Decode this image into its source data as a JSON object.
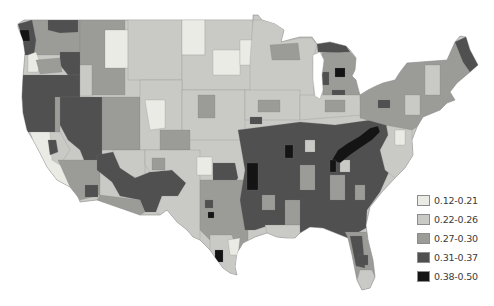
{
  "chart_data": {
    "type": "heatmap",
    "subtype": "choropleth map",
    "title": "",
    "base_class": 1,
    "legend_position": "bottom-right",
    "legend": [
      {
        "label": "0.12-0.21",
        "min": 0.12,
        "max": 0.21,
        "color": "#ebebe6"
      },
      {
        "label": "0.22-0.26",
        "min": 0.22,
        "max": 0.26,
        "color": "#c9c9c5"
      },
      {
        "label": "0.27-0.30",
        "min": 0.27,
        "max": 0.3,
        "color": "#9b9b98"
      },
      {
        "label": "0.31-0.37",
        "min": 0.31,
        "max": 0.37,
        "color": "#505050"
      },
      {
        "label": "0.38-0.50",
        "min": 0.38,
        "max": 0.5,
        "color": "#141414"
      }
    ],
    "outline": "18,24 24,20 32,20 253,20 253,15 258,15 262,20 275,24 284,30 281,42 292,39 300,37 312,37 317,44 330,42 346,46 350,50 356,58 355,70 352,76 356,80 358,88 360,95 368,90 376,86 383,83 395,80 400,72 407,63 447,60 455,42 460,36 466,37 470,50 478,65 470,72 457,83 450,92 455,100 447,103 440,110 423,117 417,127 412,140 413,155 405,168 395,178 382,192 370,207 366,225 368,240 373,260 375,277 370,288 362,290 357,280 352,255 348,238 333,232 323,228 310,227 300,233 295,238 287,238 277,237 267,233 255,237 243,243 237,253 235,267 237,275 230,273 223,268 217,260 210,250 200,240 193,237 187,230 177,222 167,210 160,215 140,215 120,208 97,200 80,202 78,197 70,187 57,180 47,167 40,153 33,140 27,130 23,113 22,97 23,77 25,53 23,40 18,27",
    "water": [
      "313,55 320,52 324,60 322,75 323,90 320,99 315,96 313,80"
    ],
    "regions": [
      {
        "class": 2,
        "points": "30,20 80,20 80,55 30,55"
      },
      {
        "class": 3,
        "points": "48,20 78,20 78,32 60,33 48,30"
      },
      {
        "class": 3,
        "points": "18,24 32,20 36,40 34,55 22,55 23,40"
      },
      {
        "class": 4,
        "points": "20,30 29,30 30,41 21,41"
      },
      {
        "class": 0,
        "points": "28,55 36,52 40,62 38,72 28,72"
      },
      {
        "class": 3,
        "points": "60,52 80,52 82,75 68,75 60,65"
      },
      {
        "class": 2,
        "points": "36,60 60,58 62,72 40,74"
      },
      {
        "class": 3,
        "points": "18,75 80,75 80,97 60,97 55,132 27,132 23,113 22,97"
      },
      {
        "class": 3,
        "points": "60,97 102,97 102,165 86,165 80,150 68,140 60,125"
      },
      {
        "class": 2,
        "points": "55,97 60,97 60,140 55,135"
      },
      {
        "class": 2,
        "points": "80,20 125,20 125,95 80,95"
      },
      {
        "class": 1,
        "points": "80,65 92,65 92,96 80,96"
      },
      {
        "class": 0,
        "points": "105,30 128,30 128,68 105,68"
      },
      {
        "class": 1,
        "points": "128,20 182,20 182,80 128,80"
      },
      {
        "class": 0,
        "points": "182,20 205,20 205,55 182,55"
      },
      {
        "class": 1,
        "points": "205,20 253,20 253,90 182,90 182,55 205,55"
      },
      {
        "class": 0,
        "points": "213,50 240,50 240,75 213,75"
      },
      {
        "class": 0,
        "points": "240,40 262,40 262,65 240,65"
      },
      {
        "class": 2,
        "points": "102,97 140,97 140,150 102,150"
      },
      {
        "class": 1,
        "points": "140,80 182,80 182,150 140,150"
      },
      {
        "class": 0,
        "points": "145,100 165,100 165,128 150,130"
      },
      {
        "class": 1,
        "points": "182,90 245,90 245,140 182,140"
      },
      {
        "class": 2,
        "points": "198,95 215,95 215,118 198,118"
      },
      {
        "class": 2,
        "points": "160,130 190,130 190,150 160,150"
      },
      {
        "class": 0,
        "points": "30,132 50,132 58,150 68,175 78,197 70,187 57,180 47,167 40,153 33,140"
      },
      {
        "class": 1,
        "points": "50,132 60,132 70,150 60,165 52,160"
      },
      {
        "class": 3,
        "points": "48,140 56,140 58,152 50,155"
      },
      {
        "class": 2,
        "points": "58,160 100,160 100,195 80,200 70,187"
      },
      {
        "class": 3,
        "points": "85,185 98,185 98,197 85,197"
      },
      {
        "class": 1,
        "points": "113,150 145,150 145,180 118,172"
      },
      {
        "class": 3,
        "points": "97,155 113,152 120,168 135,178 150,172 172,170 186,183 178,196 162,196 156,212 145,212 140,200 120,196 112,182 97,170"
      },
      {
        "class": 2,
        "points": "100,195 140,200 145,212 140,215 120,208 97,200"
      },
      {
        "class": 1,
        "points": "145,150 200,150 200,240 193,237 187,230 177,222 167,210 160,215 156,212 162,196 178,196 186,183 172,170 150,172 145,165"
      },
      {
        "class": 0,
        "points": "197,157 212,157 212,175 197,175"
      },
      {
        "class": 2,
        "points": "152,158 165,158 165,170 152,170"
      },
      {
        "class": 3,
        "points": "213,163 235,163 238,178 232,186 213,183"
      },
      {
        "class": 2,
        "points": "200,180 248,180 248,240 237,253 225,245 210,240 200,230"
      },
      {
        "class": 3,
        "points": "205,200 213,200 213,208 205,208"
      },
      {
        "class": 4,
        "points": "208,212 214,212 214,218 208,218"
      },
      {
        "class": 1,
        "points": "210,235 232,235 238,255 235,267 237,275 230,273 223,268 217,260 210,250"
      },
      {
        "class": 4,
        "points": "215,250 223,250 223,262 215,262"
      },
      {
        "class": 0,
        "points": "228,240 240,238 238,255 230,255"
      },
      {
        "class": 1,
        "points": "253,20 262,20 280,24 284,30 281,42 300,38 312,38 317,45 313,60 314,100 250,100 250,60"
      },
      {
        "class": 2,
        "points": "270,45 298,43 300,60 272,60"
      },
      {
        "class": 3,
        "points": "317,44 330,42 346,46 350,52 340,53 318,52"
      },
      {
        "class": 2,
        "points": "322,53 350,52 356,58 355,70 352,76 356,80 358,88 360,98 323,100"
      },
      {
        "class": 4,
        "points": "335,68 345,68 345,77 335,77"
      },
      {
        "class": 3,
        "points": "322,72 329,72 329,85 322,85"
      },
      {
        "class": 3,
        "points": "332,90 345,90 345,96 332,96"
      },
      {
        "class": 1,
        "points": "245,90 300,90 300,120 245,120"
      },
      {
        "class": 2,
        "points": "258,100 280,100 280,112 258,112"
      },
      {
        "class": 3,
        "points": "250,117 262,117 262,124 250,124"
      },
      {
        "class": 1,
        "points": "300,95 360,95 362,115 300,120"
      },
      {
        "class": 2,
        "points": "325,100 345,100 345,112 325,112"
      },
      {
        "class": 3,
        "points": "238,130 300,122 335,125 385,118 395,125 392,165 380,192 367,210 366,228 348,238 333,232 323,228 310,227 300,233 290,232 285,225 270,225 255,230 245,230 240,200 245,170"
      },
      {
        "class": 2,
        "points": "300,165 315,165 315,190 300,190"
      },
      {
        "class": 2,
        "points": "330,175 345,175 345,200 330,200"
      },
      {
        "class": 2,
        "points": "355,185 365,185 365,200 355,200"
      },
      {
        "class": 2,
        "points": "262,195 275,195 275,210 262,210"
      },
      {
        "class": 2,
        "points": "285,200 300,200 300,225 285,225"
      },
      {
        "class": 1,
        "points": "305,140 315,140 315,152 305,152"
      },
      {
        "class": 1,
        "points": "340,160 350,160 350,172 340,172"
      },
      {
        "class": 4,
        "points": "247,163 258,163 258,190 247,190"
      },
      {
        "class": 4,
        "points": "285,145 293,145 293,158 285,158"
      },
      {
        "class": 4,
        "points": "332,160 338,150 348,143 360,136 370,128 378,126 380,132 372,140 360,148 350,155 340,163"
      },
      {
        "class": 4,
        "points": "330,160 336,160 336,172 330,172"
      },
      {
        "class": 1,
        "points": "385,118 412,115 412,140 413,155 405,168 395,178 385,170 380,150 388,135"
      },
      {
        "class": 0,
        "points": "395,130 405,130 405,145 395,145"
      },
      {
        "class": 2,
        "points": "360,85 383,83 395,80 407,63 447,60 455,42 466,37 470,50 478,65 470,72 457,83 450,92 455,100 447,103 440,110 423,117 417,127 412,130 385,125 360,118"
      },
      {
        "class": 1,
        "points": "425,65 440,65 440,95 425,95"
      },
      {
        "class": 1,
        "points": "405,95 420,95 420,115 405,115"
      },
      {
        "class": 3,
        "points": "455,42 466,37 470,50 478,65 470,72 463,62"
      },
      {
        "class": 3,
        "points": "378,100 390,100 390,108 378,108"
      },
      {
        "class": 2,
        "points": "345,232 368,232 373,260 375,277 370,288 362,290 357,280 352,255 348,238"
      },
      {
        "class": 3,
        "points": "350,236 362,236 365,268 356,266"
      },
      {
        "class": 3,
        "points": "358,255 368,255 368,265 358,265"
      },
      {
        "class": 1,
        "points": "265,225 300,225 300,233 295,238 287,238 277,237 267,233"
      },
      {
        "class": 1,
        "points": "360,270 372,270 375,277 370,288 362,290 357,280"
      }
    ]
  }
}
